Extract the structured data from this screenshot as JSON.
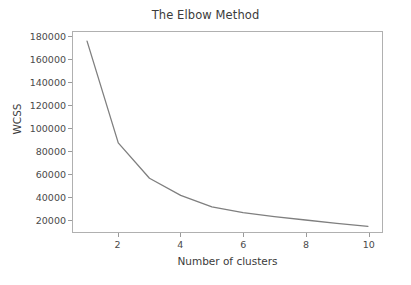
{
  "chart_data": {
    "type": "line",
    "title": "The Elbow Method",
    "xlabel": "Number of clusters",
    "ylabel": "WCSS",
    "x": [
      1,
      2,
      3,
      4,
      5,
      6,
      7,
      8,
      9,
      10
    ],
    "values": [
      176000,
      87000,
      56000,
      41000,
      31000,
      26000,
      22500,
      19500,
      16500,
      14000
    ],
    "series": [
      {
        "name": "WCSS",
        "values": [
          176000,
          87000,
          56000,
          41000,
          31000,
          26000,
          22500,
          19500,
          16500,
          14000
        ]
      }
    ],
    "xlim": [
      0.55,
      10.45
    ],
    "ylim": [
      9000,
      184000
    ],
    "xticks": [
      2,
      4,
      6,
      8,
      10
    ],
    "xtick_labels": [
      "2",
      "4",
      "6",
      "8",
      "10"
    ],
    "yticks": [
      20000,
      40000,
      60000,
      80000,
      100000,
      120000,
      140000,
      160000,
      180000
    ],
    "ytick_labels": [
      "20000",
      "40000",
      "60000",
      "80000",
      "100000",
      "120000",
      "140000",
      "160000",
      "180000"
    ],
    "grid": false,
    "legend": null,
    "line_color": "#7f7f7f",
    "line_width": 1.3,
    "background_color": "#ffffff",
    "axes_edge_color": "#b0b0b0",
    "tick_color": "#4a4a4a"
  }
}
